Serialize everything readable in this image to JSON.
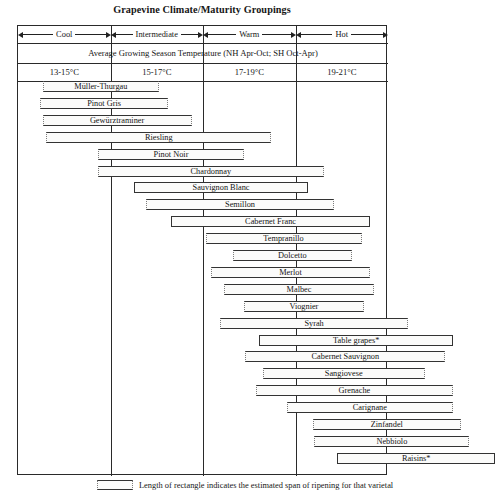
{
  "title": "Grapevine Climate/Maturity Groupings",
  "header": {
    "climate_classes": [
      "Cool",
      "Intermediate",
      "Warm",
      "Hot"
    ],
    "avg_temp_label": "Average Growing Season Temperature (NH Apr-Oct; SH Oct-Apr)",
    "temp_ranges": [
      "13-15°C",
      "15-17°C",
      "17-19°C",
      "19-21°C"
    ]
  },
  "legend": {
    "text": "Length of rectangle indicates the estimated span of ripening for that varietal"
  },
  "chart_data": {
    "type": "bar",
    "title": "Grapevine Climate/Maturity Groupings",
    "xlabel": "Average Growing Season Temperature (NH Apr-Oct; SH Oct-Apr)",
    "ylabel": "",
    "orientation": "horizontal-range",
    "xlim": [
      12.0,
      22.0
    ],
    "x_units": "°C",
    "grid": true,
    "legend_position": "below",
    "axis_bands": [
      {
        "label": "Cool",
        "range": "13-15°C",
        "start": 13,
        "end": 15
      },
      {
        "label": "Intermediate",
        "range": "15-17°C",
        "start": 15,
        "end": 17
      },
      {
        "label": "Warm",
        "range": "17-19°C",
        "start": 17,
        "end": 19
      },
      {
        "label": "Hot",
        "range": "19-21°C",
        "start": 19,
        "end": 21
      }
    ],
    "categories": [
      "Müller-Thurgau",
      "Pinot Gris",
      "Gewürztraminer",
      "Riesling",
      "Pinot Noir",
      "Chardonnay",
      "Sauvignon Blanc",
      "Semillon",
      "Cabernet Franc",
      "Tempranillo",
      "Dolcetto",
      "Merlot",
      "Malbec",
      "Viognier",
      "Syrah",
      "Table grapes*",
      "Cabernet Sauvignon",
      "Sangiovese",
      "Grenache",
      "Carignane",
      "Zinfandel",
      "Nebbiolo",
      "Raisins*"
    ],
    "bars": [
      {
        "label": "Müller-Thurgau",
        "start": 13.13,
        "end": 15.65,
        "ends": "dotted"
      },
      {
        "label": "Pinot Gris",
        "start": 13.08,
        "end": 15.84,
        "ends": "dotted"
      },
      {
        "label": "Gewürztraminer",
        "start": 13.13,
        "end": 16.35,
        "ends": "dotted"
      },
      {
        "label": "Riesling",
        "start": 13.21,
        "end": 18.07,
        "ends": "dotted"
      },
      {
        "label": "Pinot Noir",
        "start": 14.32,
        "end": 17.49,
        "ends": "dotted"
      },
      {
        "label": "Chardonnay",
        "start": 14.32,
        "end": 19.21,
        "ends": "dotted"
      },
      {
        "label": "Sauvignon Blanc",
        "start": 15.11,
        "end": 18.86,
        "ends": "solid"
      },
      {
        "label": "Semillon",
        "start": 15.36,
        "end": 19.43,
        "ends": "dotted"
      },
      {
        "label": "Cabernet Franc",
        "start": 15.9,
        "end": 20.21,
        "ends": "solid"
      },
      {
        "label": "Tempranillo",
        "start": 16.65,
        "end": 20.02,
        "ends": "dotted"
      },
      {
        "label": "Dolcetto",
        "start": 17.24,
        "end": 19.81,
        "ends": "dotted"
      },
      {
        "label": "Merlot",
        "start": 16.76,
        "end": 20.21,
        "ends": "dotted"
      },
      {
        "label": "Malbec",
        "start": 17.05,
        "end": 20.29,
        "ends": "dotted"
      },
      {
        "label": "Viognier",
        "start": 17.48,
        "end": 20.07,
        "ends": "dotted"
      },
      {
        "label": "Syrah",
        "start": 16.97,
        "end": 21.02,
        "ends": "dotted"
      },
      {
        "label": "Table grapes*",
        "start": 17.81,
        "end": 22.0,
        "ends": "solid"
      },
      {
        "label": "Cabernet Sauvignon",
        "start": 17.51,
        "end": 21.83,
        "ends": "dotted"
      },
      {
        "label": "Sangiovese",
        "start": 17.89,
        "end": 21.38,
        "ends": "dotted"
      },
      {
        "label": "Grenache",
        "start": 17.73,
        "end": 22.0,
        "ends": "dotted"
      },
      {
        "label": "Carignane",
        "start": 18.4,
        "end": 22.0,
        "ends": "dotted"
      },
      {
        "label": "Zinfandel",
        "start": 18.97,
        "end": 22.16,
        "ends": "dotted"
      },
      {
        "label": "Nebbiolo",
        "start": 19.0,
        "end": 22.35,
        "ends": "dotted"
      },
      {
        "label": "Raisins*",
        "start": 19.49,
        "end": 22.91,
        "ends": "solid"
      }
    ]
  },
  "_geometry": {
    "frame_left": 17,
    "frame_width": 370,
    "bars_top": 55,
    "row_height": 16.9,
    "bar_height": 11,
    "px_per_unit": 46.3,
    "x_origin_value": 12.6
  }
}
